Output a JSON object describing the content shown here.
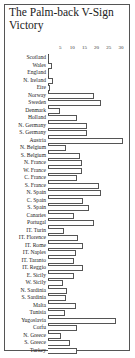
{
  "chart_data": {
    "type": "bar",
    "orientation": "horizontal",
    "title": "The Palm-back V-Sign Victory",
    "xlabel": "",
    "ylabel": "",
    "xlim": [
      0,
      32
    ],
    "x_ticks": [
      5,
      10,
      15,
      20,
      25,
      30
    ],
    "grid": false,
    "legend": null,
    "categories": [
      "Scotland",
      "Wales",
      "England",
      "N. Ireland",
      "Eire",
      "Norway",
      "Sweden",
      "Denmark",
      "Holland",
      "N. Germany",
      "S. Germany",
      "Austria",
      "N. Belgium",
      "S. Belgium",
      "N. France",
      "W. France",
      "C. France",
      "S. France",
      "N. Spain",
      "C. Spain",
      "S. Spain",
      "Canaries",
      "Portugal",
      "IT. Turin",
      "IT. Florence",
      "IT. Rome",
      "IT. Naples",
      "IT. Taranto",
      "IT. Reggio",
      "E. Sicily",
      "W. Sicily",
      "N. Sardinia",
      "S. Sardinia",
      "Malta",
      "Tunisia",
      "Yugoslavia",
      "Corfu",
      "N. Greece",
      "S. Greece",
      "Turkey"
    ],
    "values": [
      0.3,
      1.5,
      0.3,
      2,
      1,
      19,
      22,
      5,
      12,
      16,
      16,
      31,
      7.5,
      13,
      14,
      14,
      12,
      21,
      22,
      14.5,
      17,
      10.5,
      19,
      6.7,
      12.5,
      14.5,
      11.5,
      10.5,
      14.5,
      10.5,
      6,
      8,
      7.5,
      11.5,
      7,
      28,
      12,
      5.5,
      9,
      12
    ]
  },
  "tick_labels": [
    "5",
    "10",
    "15",
    "20",
    "25",
    "30"
  ]
}
